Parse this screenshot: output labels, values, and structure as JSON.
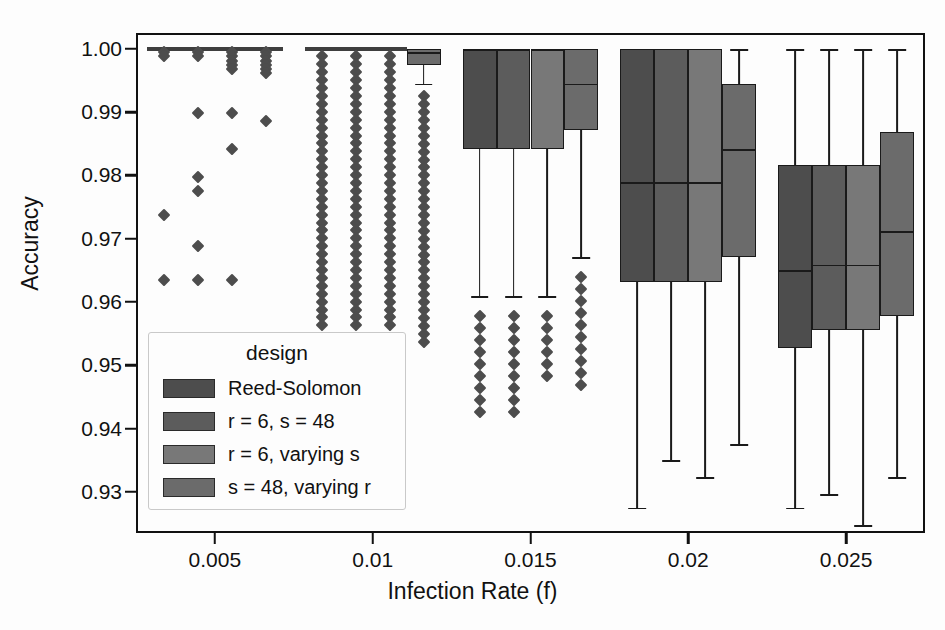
{
  "chart_data": {
    "type": "box",
    "title": "",
    "xlabel": "Infection Rate (f)",
    "ylabel": "Accuracy",
    "legend_title": "design",
    "legend_position": "lower-left-inside",
    "grid": false,
    "ylim": [
      0.9235,
      1.0025
    ],
    "yticks": [
      "1.00",
      "0.99",
      "0.98",
      "0.97",
      "0.96",
      "0.95",
      "0.94",
      "0.93"
    ],
    "ytick_values": [
      1.0,
      0.99,
      0.98,
      0.97,
      0.96,
      0.95,
      0.94,
      0.93
    ],
    "xticks": [
      "0.005",
      "0.01",
      "0.015",
      "0.02",
      "0.025"
    ],
    "xtick_values": [
      0.005,
      0.01,
      0.015,
      0.02,
      0.025
    ],
    "xlim": [
      0.0025,
      0.0275
    ],
    "series_colors": [
      "#4d4d4d",
      "#5c5c5c",
      "#787878",
      "#6b6b6b"
    ],
    "series": [
      {
        "name": "Reed-Solomon",
        "color": "#4d4d4d"
      },
      {
        "name": "r = 6, s = 48",
        "color": "#5c5c5c"
      },
      {
        "name": "r = 6, varying s",
        "color": "#787878"
      },
      {
        "name": "s = 48, varying r",
        "color": "#6b6b6b"
      }
    ],
    "groups": [
      {
        "x": 0.005,
        "boxes": [
          {
            "series": "Reed-Solomon",
            "q1": 1.0,
            "median": 1.0,
            "q3": 1.0,
            "whisker_low": 1.0,
            "whisker_high": 1.0,
            "fliers": [
              0.9995,
              0.9988,
              0.9737,
              0.9635
            ]
          },
          {
            "series": "r = 6, s = 48",
            "q1": 1.0,
            "median": 1.0,
            "q3": 1.0,
            "whisker_low": 1.0,
            "whisker_high": 1.0,
            "fliers": [
              0.9995,
              0.9988,
              0.9899,
              0.9798,
              0.9776,
              0.9688,
              0.9635
            ]
          },
          {
            "series": "r = 6, varying s",
            "q1": 1.0,
            "median": 1.0,
            "q3": 1.0,
            "whisker_low": 1.0,
            "whisker_high": 1.0,
            "fliers": [
              0.9995,
              0.9988,
              0.9981,
              0.9975,
              0.9968,
              0.9899,
              0.9842,
              0.9635
            ]
          },
          {
            "series": "s = 48, varying r",
            "q1": 1.0,
            "median": 1.0,
            "q3": 1.0,
            "whisker_low": 1.0,
            "whisker_high": 1.0,
            "fliers": [
              0.9995,
              0.9988,
              0.9981,
              0.9975,
              0.9968,
              0.9962,
              0.9886
            ]
          }
        ]
      },
      {
        "x": 0.01,
        "boxes": [
          {
            "series": "Reed-Solomon",
            "q1": 1.0,
            "median": 1.0,
            "q3": 1.0,
            "whisker_low": 1.0,
            "whisker_high": 1.0,
            "flier_from": 0.9988,
            "flier_to": 0.9551,
            "flier_step": 0.00125
          },
          {
            "series": "r = 6, s = 48",
            "q1": 1.0,
            "median": 1.0,
            "q3": 1.0,
            "whisker_low": 1.0,
            "whisker_high": 1.0,
            "flier_from": 0.9988,
            "flier_to": 0.9551,
            "flier_step": 0.00125
          },
          {
            "series": "r = 6, varying s",
            "q1": 1.0,
            "median": 1.0,
            "q3": 1.0,
            "whisker_low": 1.0,
            "whisker_high": 1.0,
            "flier_from": 0.9988,
            "flier_to": 0.9558,
            "flier_step": 0.00125
          },
          {
            "series": "s = 48, varying r",
            "q1": 0.9975,
            "median": 0.9995,
            "q3": 1.0,
            "whisker_low": 0.9945,
            "whisker_high": 1.0,
            "flier_from": 0.9925,
            "flier_to": 0.9531,
            "flier_step": 0.00125
          }
        ]
      },
      {
        "x": 0.015,
        "boxes": [
          {
            "series": "Reed-Solomon",
            "q1": 0.9841,
            "median": 1.0,
            "q3": 1.0,
            "whisker_low": 0.9609,
            "whisker_high": 1.0,
            "flier_from": 0.9578,
            "flier_to": 0.9424,
            "flier_step": 0.0019
          },
          {
            "series": "r = 6, s = 48",
            "q1": 0.9841,
            "median": 1.0,
            "q3": 1.0,
            "whisker_low": 0.9609,
            "whisker_high": 1.0,
            "flier_from": 0.9578,
            "flier_to": 0.9424,
            "flier_step": 0.0019
          },
          {
            "series": "r = 6, varying s",
            "q1": 0.9841,
            "median": 1.0,
            "q3": 1.0,
            "whisker_low": 0.9609,
            "whisker_high": 1.0,
            "flier_from": 0.9578,
            "flier_to": 0.9479,
            "flier_step": 0.0019
          },
          {
            "series": "s = 48, varying r",
            "q1": 0.9871,
            "median": 0.9945,
            "q3": 1.0,
            "whisker_low": 0.9671,
            "whisker_high": 1.0,
            "flier_from": 0.964,
            "flier_to": 0.9452,
            "flier_step": 0.0019
          }
        ]
      },
      {
        "x": 0.02,
        "boxes": [
          {
            "series": "Reed-Solomon",
            "q1": 0.9632,
            "median": 0.979,
            "q3": 1.0,
            "whisker_low": 0.9275,
            "whisker_high": 1.0,
            "fliers": []
          },
          {
            "series": "r = 6, s = 48",
            "q1": 0.9632,
            "median": 0.979,
            "q3": 1.0,
            "whisker_low": 0.935,
            "whisker_high": 1.0,
            "fliers": []
          },
          {
            "series": "r = 6, varying s",
            "q1": 0.9632,
            "median": 0.979,
            "q3": 1.0,
            "whisker_low": 0.9323,
            "whisker_high": 1.0,
            "fliers": []
          },
          {
            "series": "s = 48, varying r",
            "q1": 0.9671,
            "median": 0.9842,
            "q3": 0.9945,
            "whisker_low": 0.9375,
            "whisker_high": 1.0,
            "fliers": []
          }
        ]
      },
      {
        "x": 0.025,
        "boxes": [
          {
            "series": "Reed-Solomon",
            "q1": 0.9528,
            "median": 0.9651,
            "q3": 0.9816,
            "whisker_low": 0.9275,
            "whisker_high": 1.0,
            "fliers": []
          },
          {
            "series": "r = 6, s = 48",
            "q1": 0.9555,
            "median": 0.9659,
            "q3": 0.9816,
            "whisker_low": 0.9296,
            "whisker_high": 1.0,
            "fliers": []
          },
          {
            "series": "r = 6, varying s",
            "q1": 0.9555,
            "median": 0.9659,
            "q3": 0.9816,
            "whisker_low": 0.9247,
            "whisker_high": 1.0,
            "fliers": []
          },
          {
            "series": "s = 48, varying r",
            "q1": 0.9578,
            "median": 0.9712,
            "q3": 0.9868,
            "whisker_low": 0.9323,
            "whisker_high": 1.0,
            "fliers": []
          }
        ]
      }
    ]
  }
}
